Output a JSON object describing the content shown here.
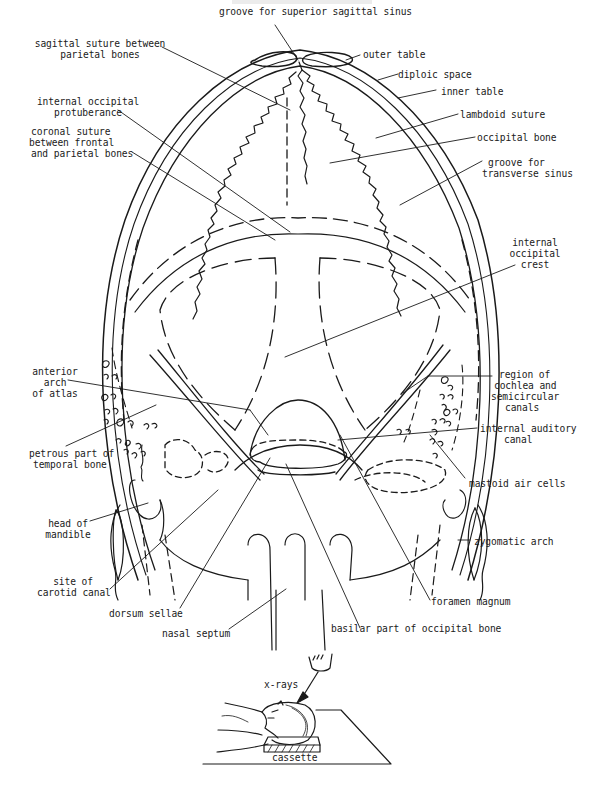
{
  "figure": {
    "stroke_color": "#1a1a1a",
    "background": "#ffffff"
  },
  "labels": {
    "groove_superior_sagittal_sinus": "groove for superior sagittal sinus",
    "sagittal_suture_1": "sagittal suture between",
    "sagittal_suture_2": "parietal bones",
    "outer_table": "outer table",
    "diploic_space": "diploic space",
    "inner_table": "inner table",
    "lambdoid_suture": "lambdoid suture",
    "occipital_bone": "occipital bone",
    "internal_occipital_protuberance_1": "internal occipital",
    "internal_occipital_protuberance_2": "protuberance",
    "coronal_suture_1": "coronal suture",
    "coronal_suture_2": "between frontal",
    "coronal_suture_3": "and parietal bones",
    "groove_transverse_sinus_1": "groove for",
    "groove_transverse_sinus_2": "transverse sinus",
    "internal_occipital_crest_1": "internal",
    "internal_occipital_crest_2": "occipital",
    "internal_occipital_crest_3": "crest",
    "anterior_arch_atlas_1": "anterior",
    "anterior_arch_atlas_2": "arch",
    "anterior_arch_atlas_3": "of atlas",
    "cochlea_region_1": "region of",
    "cochlea_region_2": "cochlea and",
    "cochlea_region_3": "semicircular",
    "cochlea_region_4": "canals",
    "internal_auditory_canal_1": "internal auditory",
    "internal_auditory_canal_2": "canal",
    "petrous_part_1": "petrous part of",
    "petrous_part_2": "temporal bone",
    "mastoid_air_cells": "mastoid air cells",
    "head_of_mandible_1": "head of",
    "head_of_mandible_2": "mandible",
    "zygomatic_arch": "zygomatic arch",
    "carotid_canal_1": "site of",
    "carotid_canal_2": "carotid canal",
    "dorsum_sellae": "dorsum sellae",
    "foramen_magnum": "foramen magnum",
    "nasal_septum": "nasal septum",
    "basilar_part": "basilar part of occipital bone",
    "x_rays": "x-rays",
    "cassette": "cassette"
  }
}
